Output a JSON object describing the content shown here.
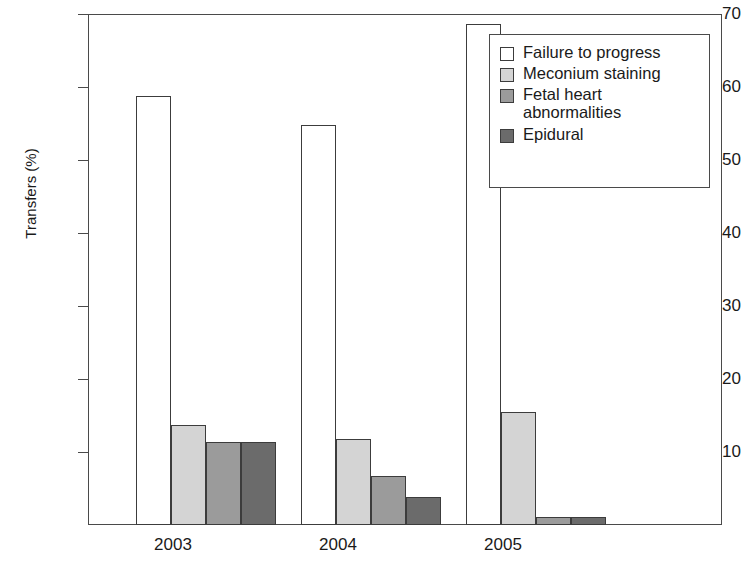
{
  "chart_data": {
    "type": "bar",
    "title": "",
    "xlabel": "",
    "ylabel": "Transfers (%)",
    "categories": [
      "2003",
      "2004",
      "2005"
    ],
    "ylim": [
      0,
      70
    ],
    "yticks": [
      0,
      10,
      20,
      30,
      40,
      50,
      60,
      70
    ],
    "ytick_labels": [
      "",
      "10",
      "20",
      "30",
      "40",
      "50",
      "60",
      "70"
    ],
    "grid": false,
    "legend_position": "top-right",
    "series": [
      {
        "name": "Failure to progress",
        "color": "#ffffff",
        "values": [
          59,
          55,
          69
        ]
      },
      {
        "name": "Meconium staining",
        "color": "#d4d4d4",
        "values": [
          13.7,
          11.9,
          15.5
        ]
      },
      {
        "name": "Fetal heart abnormalities",
        "color": "#9b9b9b",
        "values": [
          11.4,
          6.8,
          1.1
        ]
      },
      {
        "name": "Epidural",
        "color": "#6b6b6b",
        "values": [
          11.4,
          3.9,
          1.1
        ]
      }
    ]
  },
  "axis": {
    "y_title": "Transfers (%)",
    "y_labels": [
      "70",
      "60",
      "50",
      "40",
      "30",
      "20",
      "10"
    ],
    "x_labels": [
      "2003",
      "2004",
      "2005"
    ]
  },
  "legend": {
    "items": [
      {
        "label": "Failure to progress",
        "swatch": "#ffffff"
      },
      {
        "label": "Meconium staining",
        "swatch": "#d4d4d4"
      },
      {
        "label": "Fetal heart\nabnormalities",
        "swatch": "#9b9b9b"
      },
      {
        "label": "Epidural",
        "swatch": "#6b6b6b"
      }
    ]
  }
}
